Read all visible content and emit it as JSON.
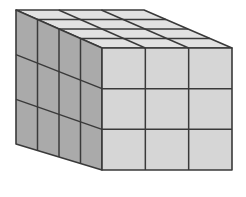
{
  "figure": {
    "dimensions": {
      "width_cubes": 3,
      "height_cubes": 3,
      "depth_cubes": 4
    },
    "colors": {
      "background": "#ffffff",
      "top_face": "#e2e2e2",
      "front_face": "#d6d6d6",
      "side_face": "#aaaaaa",
      "edge": "#3a3a3a"
    },
    "vertices": {
      "back_top_left": [
        16,
        10
      ],
      "back_top_right": [
        144,
        10
      ],
      "front_top_left": [
        102,
        48
      ],
      "front_top_right": [
        232,
        48
      ],
      "front_bottom_left": [
        102,
        170
      ],
      "front_bottom_right": [
        232,
        170
      ],
      "back_bottom_left": [
        16,
        144
      ]
    }
  }
}
